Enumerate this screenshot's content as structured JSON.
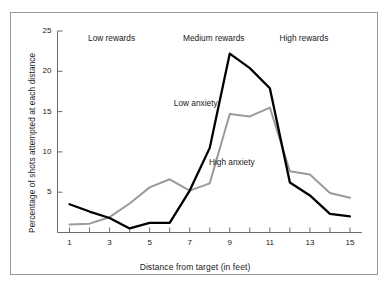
{
  "figure": {
    "background_color": "#ffffff",
    "border_color": "#9a9a9a"
  },
  "chart_data": {
    "type": "line",
    "title": "",
    "xlabel": "Distance from target (in feet)",
    "ylabel": "Percentage of shots attempted at each distance",
    "xlim": [
      0.4,
      15.6
    ],
    "ylim": [
      0,
      25
    ],
    "xticks": [
      1,
      2,
      3,
      4,
      5,
      6,
      7,
      8,
      9,
      10,
      11,
      12,
      13,
      14,
      15
    ],
    "xticklabels": [
      "1",
      "",
      "3",
      "",
      "5",
      "",
      "7",
      "",
      "9",
      "",
      "11",
      "",
      "13",
      "",
      "15"
    ],
    "yticks": [
      5,
      10,
      15,
      20,
      25
    ],
    "yticklabels": [
      "5",
      "10",
      "15",
      "20",
      "25"
    ],
    "grid": false,
    "legend_position": "inline-annotations",
    "x": [
      1,
      2,
      3,
      4,
      5,
      6,
      7,
      8,
      9,
      10,
      11,
      12,
      13,
      14,
      15
    ],
    "series": [
      {
        "name": "Low anxiety",
        "color": "#000000",
        "width": 2.3,
        "values": [
          3.5,
          2.6,
          1.8,
          0.5,
          1.2,
          1.2,
          5.2,
          10.5,
          22.2,
          20.4,
          17.9,
          6.2,
          4.6,
          2.3,
          2.0
        ]
      },
      {
        "name": "High anxiety",
        "color": "#9a9a9a",
        "width": 2.0,
        "values": [
          1.0,
          1.1,
          1.9,
          3.6,
          5.6,
          6.6,
          5.2,
          6.1,
          14.7,
          14.4,
          15.5,
          7.6,
          7.2,
          4.9,
          4.3
        ]
      }
    ],
    "annotations": [
      {
        "name": "low-rewards",
        "text": "Low rewards",
        "x": 3.1,
        "y": 24.0
      },
      {
        "name": "medium-rewards",
        "text": "Medium rewards",
        "x": 8.2,
        "y": 24.0
      },
      {
        "name": "high-rewards",
        "text": "High rewards",
        "x": 12.7,
        "y": 24.0
      },
      {
        "name": "low-anxiety-label",
        "text": "Low anxiety",
        "x": 7.3,
        "y": 16.0
      },
      {
        "name": "high-anxiety-label",
        "text": "High anxiety",
        "x": 9.1,
        "y": 8.6
      }
    ]
  }
}
